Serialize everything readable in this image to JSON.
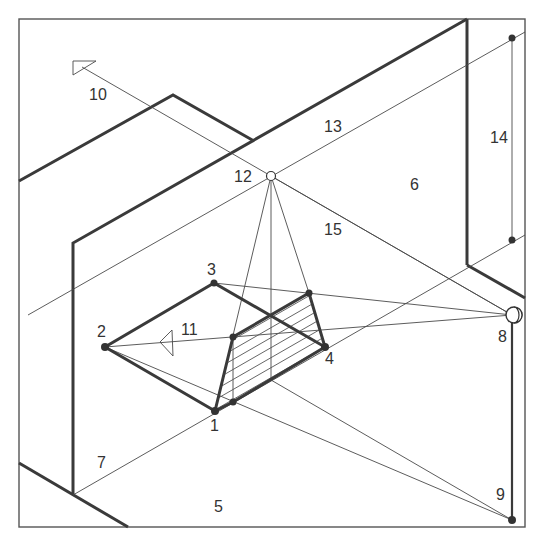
{
  "diagram": {
    "colors": {
      "line": "#3a3a3a",
      "thin_line": "#4a4a4a",
      "background": "#ffffff"
    },
    "labels": [
      {
        "id": "1",
        "text": "1",
        "x": 210,
        "y": 431
      },
      {
        "id": "2",
        "text": "2",
        "x": 97,
        "y": 337
      },
      {
        "id": "3",
        "text": "3",
        "x": 207,
        "y": 275
      },
      {
        "id": "4",
        "text": "4",
        "x": 325,
        "y": 364
      },
      {
        "id": "5",
        "text": "5",
        "x": 214,
        "y": 512
      },
      {
        "id": "6",
        "text": "6",
        "x": 410,
        "y": 190
      },
      {
        "id": "7",
        "text": "7",
        "x": 97,
        "y": 468
      },
      {
        "id": "8",
        "text": "8",
        "x": 498,
        "y": 342
      },
      {
        "id": "9",
        "text": "9",
        "x": 496,
        "y": 500
      },
      {
        "id": "10",
        "text": "10",
        "x": 89,
        "y": 100
      },
      {
        "id": "11",
        "text": "11",
        "x": 181,
        "y": 335
      },
      {
        "id": "12",
        "text": "12",
        "x": 234,
        "y": 182
      },
      {
        "id": "13",
        "text": "13",
        "x": 324,
        "y": 132
      },
      {
        "id": "14",
        "text": "14",
        "x": 490,
        "y": 143
      },
      {
        "id": "15",
        "text": "15",
        "x": 324,
        "y": 235
      }
    ],
    "points": {
      "p1": [
        215,
        411
      ],
      "p2": [
        105,
        347
      ],
      "p3": [
        214,
        283
      ],
      "p4": [
        325,
        347
      ],
      "p12": [
        271,
        176
      ],
      "p8": [
        512,
        315
      ],
      "p9": [
        512,
        520
      ],
      "p14_top": [
        512,
        38
      ],
      "p14_bottom": [
        512,
        240
      ],
      "shadow_a": [
        233,
        337
      ],
      "shadow_b": [
        309,
        293
      ],
      "shadow_c": [
        325,
        347
      ],
      "shadow_d": [
        233,
        402
      ]
    }
  }
}
